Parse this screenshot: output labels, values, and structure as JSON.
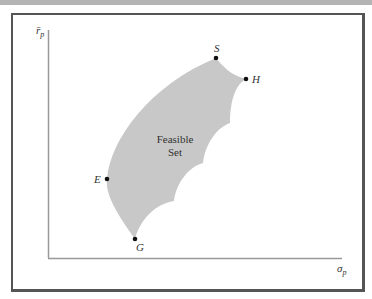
{
  "diagram": {
    "region_label_line1": "Feasible",
    "region_label_line2": "Set",
    "y_axis_label": "r̄",
    "y_axis_sub": "p",
    "x_axis_label": "σ",
    "x_axis_sub": "p",
    "points": [
      {
        "name": "S",
        "x": 216,
        "y": 58
      },
      {
        "name": "H",
        "x": 246,
        "y": 79
      },
      {
        "name": "E",
        "x": 107,
        "y": 179
      },
      {
        "name": "G",
        "x": 135,
        "y": 239
      }
    ],
    "colors": {
      "region_fill": "#c8c8c8",
      "axis": "#999999",
      "frame": "#555555",
      "point": "#111111"
    }
  }
}
